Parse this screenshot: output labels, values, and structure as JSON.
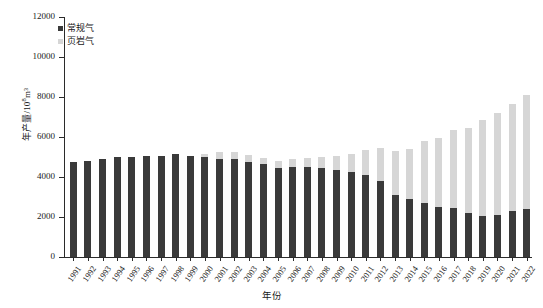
{
  "chart_data": {
    "type": "bar",
    "stacked": true,
    "title": "",
    "xlabel": "年份",
    "ylabel": "年产量/10⁸m³",
    "ylabel_base": "年产量/10",
    "ylabel_exp": "8",
    "ylabel_unit": "m³",
    "grid": false,
    "legend_position": "top-left",
    "ylim": [
      0,
      12000
    ],
    "ytick_values": [
      0,
      2000,
      4000,
      6000,
      8000,
      10000,
      12000
    ],
    "ytick_labels": [
      "0",
      "2000",
      "4000",
      "6000",
      "8000",
      "10000",
      "12000"
    ],
    "categories": [
      "1991",
      "1992",
      "1993",
      "1994",
      "1995",
      "1996",
      "1997",
      "1998",
      "1999",
      "2000",
      "2001",
      "2002",
      "2003",
      "2004",
      "2005",
      "2006",
      "2007",
      "2008",
      "2009",
      "2010",
      "2011",
      "2012",
      "2013",
      "2014",
      "2015",
      "2016",
      "2017",
      "2018",
      "2019",
      "2020",
      "2021",
      "2022"
    ],
    "series": [
      {
        "name": "常规气",
        "color": "#3a3a3a",
        "values": [
          4750,
          4800,
          4900,
          5000,
          5000,
          5050,
          5050,
          5150,
          5050,
          5000,
          4900,
          4900,
          4750,
          4650,
          4450,
          4500,
          4500,
          4450,
          4350,
          4250,
          4100,
          3800,
          3100,
          2900,
          2700,
          2500,
          2450,
          2200,
          2050,
          2100,
          2300,
          2400
        ]
      },
      {
        "name": "页岩气",
        "color": "#d6d6d6",
        "values": [
          0,
          0,
          0,
          0,
          0,
          0,
          0,
          0,
          0,
          150,
          350,
          350,
          350,
          300,
          350,
          400,
          450,
          550,
          700,
          900,
          1250,
          1650,
          2200,
          2500,
          3100,
          3450,
          3900,
          4250,
          4800,
          5100,
          5350,
          5700
        ]
      }
    ],
    "totals": [
      4750,
      4800,
      4900,
      5000,
      5000,
      5050,
      5050,
      5150,
      5050,
      5150,
      5250,
      5250,
      5100,
      4950,
      4800,
      4900,
      4950,
      5000,
      5050,
      5150,
      5350,
      5450,
      5300,
      5400,
      5800,
      5950,
      6350,
      6450,
      6850,
      7200,
      7650,
      8100
    ]
  },
  "legend": {
    "items": [
      {
        "label": "常规气",
        "color": "#3a3a3a"
      },
      {
        "label": "页岩气",
        "color": "#d6d6d6"
      }
    ]
  }
}
